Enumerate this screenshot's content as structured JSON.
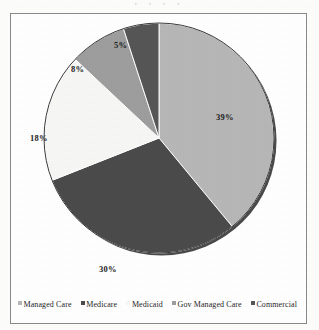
{
  "scan_artifact": {
    "top_bleed_text": "▪ ▪ ▪ ▪"
  },
  "chart_data": {
    "type": "pie",
    "title": "",
    "subtitle": "",
    "xlabel": "",
    "ylabel": "",
    "grid": false,
    "legend_position": "bottom",
    "start_angle_deg": 0,
    "direction": "clockwise",
    "categories": [
      "Managed Care",
      "Medicare",
      "Medicaid",
      "Gov Managed Care",
      "Commercial"
    ],
    "values": [
      39,
      30,
      18,
      8,
      5
    ],
    "value_unit": "%",
    "data_labels": [
      "39%",
      "30%",
      "18%",
      "8%",
      "5%"
    ],
    "colors": [
      "#b7b7b7",
      "#4b4b4b",
      "#f7f7f6",
      "#9e9e9e",
      "#565656"
    ],
    "slices": [
      {
        "label": "Managed Care",
        "value": 39,
        "data_label": "39%",
        "color": "#b7b7b7",
        "sweep_deg": 140.4
      },
      {
        "label": "Medicare",
        "value": 30,
        "data_label": "30%",
        "color": "#4b4b4b",
        "sweep_deg": 108.0
      },
      {
        "label": "Medicaid",
        "value": 18,
        "data_label": "18%",
        "color": "#f7f7f6",
        "sweep_deg": 64.8
      },
      {
        "label": "Gov Managed Care",
        "value": 8,
        "data_label": "8%",
        "color": "#9e9e9e",
        "sweep_deg": 28.8
      },
      {
        "label": "Commercial",
        "value": 5,
        "data_label": "5%",
        "color": "#565656",
        "sweep_deg": 18.0
      }
    ]
  },
  "legend": {
    "items": [
      {
        "label": "Managed Care",
        "color": "#b7b7b7"
      },
      {
        "label": "Medicare",
        "color": "#4b4b4b"
      },
      {
        "label": "Medicaid",
        "color": "#f7f7f6"
      },
      {
        "label": "Gov Managed Care",
        "color": "#9e9e9e"
      },
      {
        "label": "Commercial",
        "color": "#565656"
      }
    ]
  },
  "labels": {
    "l0": "39%",
    "l1": "30%",
    "l2": "18%",
    "l3": "8%",
    "l4": "5%"
  }
}
